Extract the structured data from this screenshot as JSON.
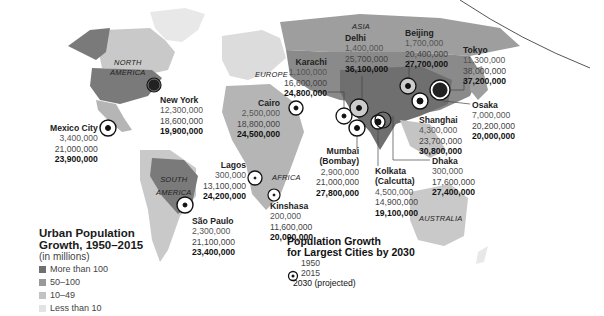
{
  "continents": {
    "north_america": [
      "NORTH",
      "AMERICA"
    ],
    "south_america": [
      "SOUTH",
      "AMERICA"
    ],
    "europe": "EUROPE",
    "africa": "AFRICA",
    "asia": "ASIA",
    "australia": "AUSTRALIA"
  },
  "cities": [
    {
      "name": "New York",
      "y1950": "12,300,000",
      "y2015": "18,600,000",
      "y2030": "19,900,000"
    },
    {
      "name": "Mexico City",
      "y1950": "3,400,000",
      "y2015": "21,000,000",
      "y2030": "23,900,000"
    },
    {
      "name": "São Paulo",
      "y1950": "2,300,000",
      "y2015": "21,100,000",
      "y2030": "23,400,000"
    },
    {
      "name": "Cairo",
      "y1950": "2,500,000",
      "y2015": "18,800,000",
      "y2030": "24,500,000"
    },
    {
      "name": "Lagos",
      "y1950": "300,000",
      "y2015": "13,100,000",
      "y2030": "24,200,000"
    },
    {
      "name": "Kinshasa",
      "y1950": "200,000",
      "y2015": "11,600,000",
      "y2030": "20,000,000"
    },
    {
      "name": "Karachi",
      "y1950": "1,100,000",
      "y2015": "16,600,000",
      "y2030": "24,800,000"
    },
    {
      "name": "Delhi",
      "y1950": "1,400,000",
      "y2015": "25,700,000",
      "y2030": "36,100,000"
    },
    {
      "name": "Mumbai",
      "name2": "(Bombay)",
      "y1950": "2,900,000",
      "y2015": "21,000,000",
      "y2030": "27,800,000"
    },
    {
      "name": "Kolkata",
      "name2": "(Calcutta)",
      "y1950": "4,500,000",
      "y2015": "14,900,000",
      "y2030": "19,100,000"
    },
    {
      "name": "Dhaka",
      "y1950": "300,000",
      "y2015": "17,600,000",
      "y2030": "27,400,000"
    },
    {
      "name": "Beijing",
      "y1950": "1,700,000",
      "y2015": "20,400,000",
      "y2030": "27,700,000"
    },
    {
      "name": "Shanghai",
      "y1950": "4,300,000",
      "y2015": "23,700,000",
      "y2030": "30,800,000"
    },
    {
      "name": "Tokyo",
      "y1950": "11,300,000",
      "y2015": "38,000,000",
      "y2030": "37,200,000"
    },
    {
      "name": "Osaka",
      "y1950": "7,000,000",
      "y2015": "20,200,000",
      "y2030": "20,000,000"
    }
  ],
  "legend": {
    "title_line1": "Urban Population",
    "title_line2": "Growth, 1950–2015",
    "subtitle": "(in millions)",
    "items": [
      {
        "label": "More than 100",
        "color": "#6f6f6f"
      },
      {
        "label": "50–100",
        "color": "#9a9a9a"
      },
      {
        "label": "10–49",
        "color": "#c2c2c2"
      },
      {
        "label": "Less than 10",
        "color": "#e3e3e3"
      }
    ]
  },
  "growth_legend": {
    "title_line1": "Population Growth",
    "title_line2": "for Largest Cities by 2030",
    "rows": [
      "1950",
      "2015",
      "2030 (projected)"
    ]
  },
  "colors": {
    "more_than_100": "#6f6f6f",
    "50_100": "#9a9a9a",
    "10_49": "#c2c2c2",
    "less_than_10": "#e3e3e3",
    "ring": "#111111"
  }
}
